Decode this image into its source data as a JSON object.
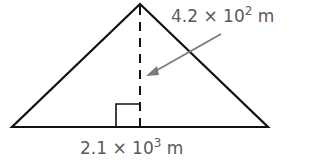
{
  "diagram": {
    "shape": "triangle",
    "height_label": {
      "mantissa": "4.2 × 10",
      "exponent": "2",
      "unit": " m"
    },
    "base_label": {
      "mantissa": "2.1 × 10",
      "exponent": "3",
      "unit": " m"
    },
    "colors": {
      "lines": "#111111",
      "arrow": "#7a7a7a",
      "text": "#5a5a5a"
    }
  }
}
